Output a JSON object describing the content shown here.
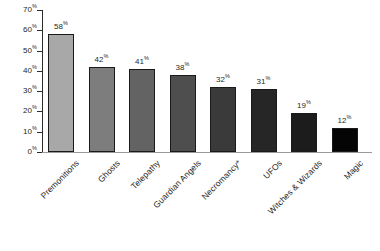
{
  "chart_data": {
    "type": "bar",
    "title": "",
    "subtitle": "",
    "xlabel": "",
    "ylabel": "",
    "ylim": [
      0,
      70
    ],
    "grid": false,
    "legend": null,
    "y_ticks": [
      {
        "value": 70,
        "label": "70",
        "suffix": "%"
      },
      {
        "value": 60,
        "label": "60",
        "suffix": "%"
      },
      {
        "value": 50,
        "label": "50",
        "suffix": "%"
      },
      {
        "value": 40,
        "label": "40",
        "suffix": "%"
      },
      {
        "value": 30,
        "label": "30",
        "suffix": "%"
      },
      {
        "value": 20,
        "label": "20",
        "suffix": "%"
      },
      {
        "value": 10,
        "label": "10",
        "suffix": "%"
      },
      {
        "value": 0,
        "label": "0",
        "suffix": "%"
      }
    ],
    "categories": [
      "Premonitions",
      "Ghosts",
      "Telepathy",
      "Guardian Angels",
      "Necromancy*",
      "UFOs",
      "Witches & Wizards",
      "Magic"
    ],
    "values": [
      58,
      42,
      41,
      38,
      32,
      31,
      19,
      12
    ],
    "value_labels": [
      "58",
      "42",
      "41",
      "38",
      "32",
      "31",
      "19",
      "12"
    ],
    "value_suffix": "%",
    "bar_colors": [
      "#a8a8a8",
      "#7d7d7d",
      "#636363",
      "#4e4e4e",
      "#3a3a3a",
      "#262626",
      "#1c1c1c",
      "#050505"
    ],
    "bar_border_color": "#1a1a1a",
    "axis_color": "#2b2b2b",
    "baseline_color": "#9a9a9a",
    "background": "#ffffff",
    "text_color": "#1f1f1f"
  }
}
